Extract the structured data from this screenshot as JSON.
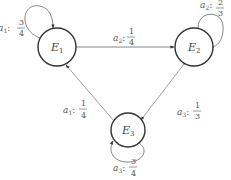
{
  "diagram": {
    "type": "state-transition",
    "nodes": [
      {
        "id": "E1",
        "label": "E",
        "sub": "1"
      },
      {
        "id": "E2",
        "label": "E",
        "sub": "2"
      },
      {
        "id": "E3",
        "label": "E",
        "sub": "3"
      }
    ],
    "edges": [
      {
        "from": "E1",
        "to": "E1",
        "action": "a",
        "action_sub": "1",
        "num": "3",
        "den": "4"
      },
      {
        "from": "E1",
        "to": "E2",
        "action": "a",
        "action_sub": "2",
        "num": "1",
        "den": "4"
      },
      {
        "from": "E2",
        "to": "E2",
        "action": "a",
        "action_sub": "2",
        "num": "2",
        "den": "3"
      },
      {
        "from": "E2",
        "to": "E3",
        "action": "a",
        "action_sub": "3",
        "num": "1",
        "den": "3"
      },
      {
        "from": "E3",
        "to": "E3",
        "action": "a",
        "action_sub": "3",
        "num": "3",
        "den": "4"
      },
      {
        "from": "E3",
        "to": "E1",
        "action": "a",
        "action_sub": "1",
        "num": "1",
        "den": "4"
      }
    ]
  }
}
